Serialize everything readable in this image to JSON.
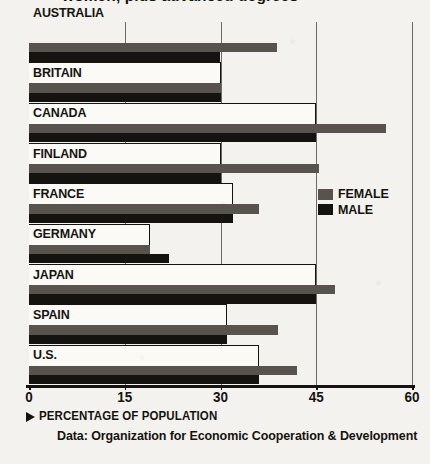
{
  "title": "women, plus advanced degrees",
  "legend": {
    "position": "inside-right",
    "items": [
      {
        "label": "FEMALE",
        "color": "#58544d",
        "name": "female"
      },
      {
        "label": "MALE",
        "color": "#15130f",
        "name": "male"
      }
    ]
  },
  "axis_caption": "PERCENTAGE OF POPULATION",
  "source": "Data: Organization for Economic Cooperation & Development",
  "chart_data": {
    "type": "bar",
    "orientation": "horizontal",
    "title": "women, plus advanced degrees",
    "xlabel": "PERCENTAGE OF POPULATION",
    "ylabel": "",
    "xlim": [
      0,
      60
    ],
    "ticks": [
      "0",
      "15",
      "30",
      "45",
      "60"
    ],
    "tick_values": [
      0,
      15,
      30,
      45,
      60
    ],
    "grid": true,
    "grid_axis": "x",
    "legend_position": "inside-right",
    "categories": [
      "AUSTRALIA",
      "BRITAIN",
      "CANADA",
      "FINLAND",
      "FRANCE",
      "GERMANY",
      "JAPAN",
      "SPAIN",
      "U.S."
    ],
    "series": [
      {
        "name": "FEMALE",
        "color": "#58544d",
        "values": [
          38.9,
          30.0,
          55.9,
          45.5,
          36.0,
          19.0,
          48.0,
          39.0,
          42.0
        ]
      },
      {
        "name": "MALE",
        "color": "#15130f",
        "values": [
          29.9,
          30.0,
          45.0,
          30.0,
          32.0,
          22.0,
          45.0,
          31.0,
          36.0
        ]
      }
    ]
  }
}
